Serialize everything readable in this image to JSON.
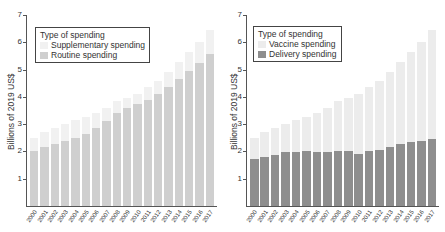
{
  "colors": {
    "routine": "#cfcfcf",
    "supplementary": "#f1f1f1",
    "delivery": "#8e8e8e",
    "vaccine": "#ececec"
  },
  "chart_data": [
    {
      "type": "bar",
      "stacked": true,
      "title": "",
      "xlabel": "",
      "ylabel": "Billions of 2019 US$",
      "ylim": [
        0,
        7
      ],
      "yticks": [
        1,
        2,
        3,
        4,
        5,
        6,
        7
      ],
      "legend_title": "Type of spending",
      "legend_position": "upper left",
      "categories": [
        "2000",
        "2001",
        "2002",
        "2003",
        "2004",
        "2005",
        "2006",
        "2007",
        "2008",
        "2009",
        "2010",
        "2011",
        "2012",
        "2013",
        "2014",
        "2015",
        "2016",
        "2017"
      ],
      "series": [
        {
          "name": "Routine spending",
          "values": [
            2.0,
            2.15,
            2.27,
            2.37,
            2.48,
            2.65,
            2.87,
            3.1,
            3.4,
            3.6,
            3.73,
            3.88,
            4.12,
            4.37,
            4.67,
            4.95,
            5.25,
            5.58
          ]
        },
        {
          "name": "Supplementary spending",
          "values": [
            0.5,
            0.55,
            0.58,
            0.65,
            0.67,
            0.63,
            0.55,
            0.5,
            0.45,
            0.37,
            0.37,
            0.47,
            0.48,
            0.53,
            0.61,
            0.7,
            0.75,
            0.87
          ]
        }
      ]
    },
    {
      "type": "bar",
      "stacked": true,
      "title": "",
      "xlabel": "",
      "ylabel": "Billions of 2019 US$",
      "ylim": [
        0,
        7
      ],
      "yticks": [
        1,
        2,
        3,
        4,
        5,
        6,
        7
      ],
      "legend_title": "Type of spending",
      "legend_position": "upper left",
      "categories": [
        "2000",
        "2001",
        "2002",
        "2003",
        "2004",
        "2005",
        "2006",
        "2007",
        "2008",
        "2009",
        "2010",
        "2011",
        "2012",
        "2013",
        "2014",
        "2015",
        "2016",
        "2017"
      ],
      "series": [
        {
          "name": "Delivery spending",
          "values": [
            1.72,
            1.8,
            1.88,
            1.97,
            1.98,
            2.02,
            1.98,
            1.98,
            2.02,
            2.0,
            1.9,
            2.0,
            2.05,
            2.17,
            2.28,
            2.33,
            2.4,
            2.45
          ]
        },
        {
          "name": "Vaccine spending",
          "values": [
            0.78,
            0.9,
            0.97,
            1.05,
            1.17,
            1.26,
            1.44,
            1.62,
            1.83,
            1.97,
            2.2,
            2.35,
            2.55,
            2.73,
            3.0,
            3.32,
            3.6,
            4.0
          ]
        }
      ]
    }
  ]
}
